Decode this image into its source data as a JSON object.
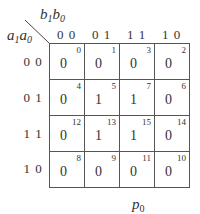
{
  "kmap": {
    "column_variables": {
      "base": "b",
      "first_sub": "1",
      "second_base": "b",
      "second_sub": "0"
    },
    "row_variables": {
      "base": "a",
      "first_sub": "1",
      "second_base": "a",
      "second_sub": "0"
    },
    "column_headers": [
      "0 0",
      "0 1",
      "1 1",
      "1 0"
    ],
    "row_headers": [
      "0 0",
      "0 1",
      "1 1",
      "1 0"
    ],
    "cells": [
      [
        {
          "value": "0",
          "index": "0"
        },
        {
          "value": "0",
          "index": "1"
        },
        {
          "value": "0",
          "index": "3"
        },
        {
          "value": "0",
          "index": "2"
        }
      ],
      [
        {
          "value": "0",
          "index": "4"
        },
        {
          "value": "1",
          "index": "5"
        },
        {
          "value": "1",
          "index": "7"
        },
        {
          "value": "0",
          "index": "6"
        }
      ],
      [
        {
          "value": "0",
          "index": "12"
        },
        {
          "value": "1",
          "index": "13"
        },
        {
          "value": "1",
          "index": "15"
        },
        {
          "value": "0",
          "index": "14"
        }
      ],
      [
        {
          "value": "0",
          "index": "8"
        },
        {
          "value": "0",
          "index": "9"
        },
        {
          "value": "0",
          "index": "11"
        },
        {
          "value": "0",
          "index": "10"
        }
      ]
    ],
    "caption": {
      "base": "p",
      "sub": "0"
    }
  }
}
